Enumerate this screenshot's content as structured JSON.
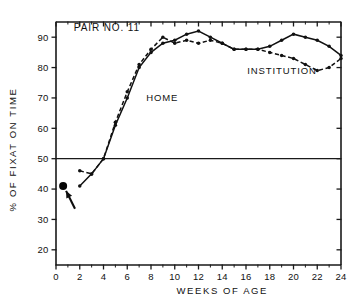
{
  "chart_data": {
    "type": "line",
    "title": "PAIR NO. 11",
    "xlabel": "WEEKS OF AGE",
    "ylabel": "% OF FIXAT ON TIME",
    "xlim": [
      0,
      24
    ],
    "ylim": [
      15,
      95
    ],
    "grid": false,
    "legend_position": "inline-annotations",
    "x_ticks": [
      0,
      2,
      4,
      6,
      8,
      10,
      12,
      14,
      16,
      18,
      20,
      22,
      24
    ],
    "x_tick_labels": [
      "0",
      "2",
      "4",
      "6",
      "8",
      "10",
      "12",
      "14",
      "16",
      "18",
      "20",
      "22",
      "24"
    ],
    "x_minor_ticks": [
      1,
      3,
      5,
      7,
      9,
      11,
      13,
      15,
      17,
      19,
      21,
      23
    ],
    "y_ticks": [
      20,
      30,
      40,
      50,
      60,
      70,
      80,
      90
    ],
    "y_tick_labels": [
      "20",
      "30",
      "40",
      "50",
      "60",
      "70",
      "80",
      "90"
    ],
    "reference_line": {
      "y": 50,
      "label": "50% chance level"
    },
    "series": [
      {
        "name": "HOME",
        "style": "solid",
        "x": [
          2,
          3,
          4,
          5,
          6,
          7,
          8,
          9,
          10,
          11,
          12,
          13,
          14,
          15,
          16,
          17,
          18,
          19,
          20,
          21,
          22,
          23,
          24
        ],
        "values": [
          41,
          45,
          50,
          61,
          70,
          80,
          85,
          88,
          89,
          91,
          92,
          90,
          88,
          86,
          86,
          86,
          87,
          89,
          91,
          90,
          89,
          87,
          84
        ]
      },
      {
        "name": "INSTITUTION",
        "style": "dashed",
        "x": [
          2,
          3,
          4,
          5,
          6,
          7,
          8,
          9,
          10,
          11,
          12,
          13,
          14,
          15,
          16,
          17,
          18,
          19,
          20,
          21,
          22,
          23,
          24
        ],
        "values": [
          46,
          45,
          50,
          62,
          72,
          81,
          86,
          90,
          88,
          89,
          88,
          89,
          88,
          86,
          86,
          86,
          85,
          84,
          83,
          81,
          79,
          80,
          83
        ]
      }
    ],
    "annotations": [
      {
        "name": "home-label",
        "text": "HOME",
        "x": 7.6,
        "y": 69
      },
      {
        "name": "institution-label",
        "text": "INSTITUTION",
        "x": 16.1,
        "y": 78
      },
      {
        "name": "title-label",
        "text": "PAIR NO. 11",
        "x": 1.5,
        "y": 92
      }
    ],
    "highlight_point": {
      "name": "pre-test-baseline",
      "x": 0.6,
      "y": 41,
      "marker": "filled-circle-large",
      "arrow": {
        "from_x": 1.6,
        "from_y": 33.5,
        "to_x": 0.85,
        "to_y": 39.4
      }
    },
    "colors": {
      "axis": "#1a1a1a",
      "series": "#111111",
      "background": "#ffffff"
    }
  },
  "axis_titles": {
    "x": "WEEKS OF AGE",
    "y": "% OF FIXAT ON TIME"
  }
}
